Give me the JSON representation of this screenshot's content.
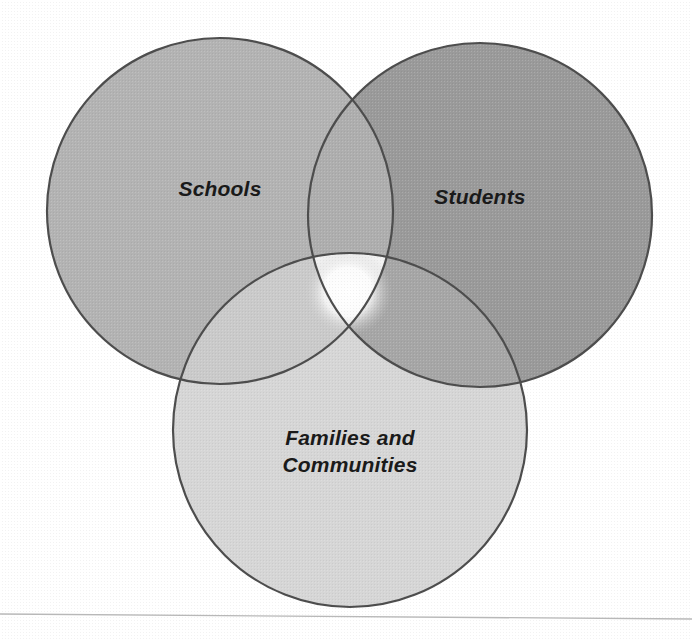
{
  "figure": {
    "type": "venn-diagram-3-circle",
    "background_color": "#ffffff",
    "outline_color": "#4d4d4d",
    "text_color": "#1a1a1a",
    "width": 692,
    "height": 640
  },
  "sets": [
    {
      "id": "schools",
      "label": "Schools",
      "fill_color": "#b3b3b3",
      "label_position": "upper-left",
      "circle": {
        "cx": 220,
        "cy": 211,
        "r": 173
      }
    },
    {
      "id": "students",
      "label": "Students",
      "fill_color": "#9a9a9a",
      "label_position": "upper-right",
      "circle": {
        "cx": 480,
        "cy": 215,
        "r": 172
      }
    },
    {
      "id": "families-and-communities",
      "label": "Families and\nCommunities",
      "fill_color": "#d6d6d6",
      "label_position": "bottom-center",
      "circle": {
        "cx": 350,
        "cy": 430,
        "r": 177
      }
    }
  ],
  "intersections": [
    {
      "id": "schools-students",
      "sets": [
        "schools",
        "students"
      ],
      "fill_color": "#aeaeae",
      "label": ""
    },
    {
      "id": "schools-families",
      "sets": [
        "schools",
        "families-and-communities"
      ],
      "fill_color": "#cacaca",
      "label": ""
    },
    {
      "id": "students-families",
      "sets": [
        "students",
        "families-and-communities"
      ],
      "fill_color": "#a6a6a6",
      "label": ""
    },
    {
      "id": "schools-students-families",
      "sets": [
        "schools",
        "students",
        "families-and-communities"
      ],
      "fill_color": "#f2f2f2",
      "label": ""
    }
  ],
  "center_highlight": {
    "cx": 348,
    "cy": 292,
    "r": 44,
    "inner_color": "#ffffff",
    "outer_color": "#c9c9c9"
  },
  "page_edge": {
    "visible": true,
    "color": "#b8b8b8",
    "left_y": 613,
    "right_y": 618
  }
}
